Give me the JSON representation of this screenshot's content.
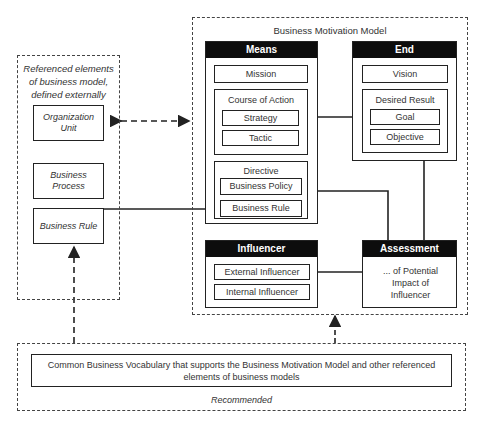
{
  "diagram": {
    "external": {
      "title": "Referenced elements of business model, defined externally",
      "items": [
        "Organization Unit",
        "Business Process",
        "Business Rule"
      ]
    },
    "bmm": {
      "title": "Business Motivation Model",
      "means": {
        "header": "Means",
        "mission": "Mission",
        "course_of_action": {
          "label": "Course of Action",
          "items": [
            "Strategy",
            "Tactic"
          ]
        },
        "directive": {
          "label": "Directive",
          "items": [
            "Business Policy",
            "Business Rule"
          ]
        }
      },
      "end": {
        "header": "End",
        "vision": "Vision",
        "desired_result": {
          "label": "Desired Result",
          "items": [
            "Goal",
            "Objective"
          ]
        }
      },
      "influencer": {
        "header": "Influencer",
        "items": [
          "External Influencer",
          "Internal Influencer"
        ]
      },
      "assessment": {
        "header": "Assessment",
        "text": "... of Potential Impact of Influencer"
      }
    },
    "vocabulary": {
      "text": "Common Business Vocabulary that supports the Business Motivation Model and other referenced elements of business models",
      "caption": "Recommended"
    },
    "colors": {
      "header_bg": "#0d0d0d",
      "line": "#222222",
      "text": "#333333"
    }
  }
}
